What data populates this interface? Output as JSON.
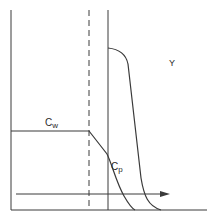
{
  "diagram": {
    "labels": {
      "cw": {
        "main": "C",
        "sub": "w"
      },
      "cp": {
        "main": "C",
        "sub": "p"
      },
      "y": "Y"
    },
    "colors": {
      "line": "#3a3a3a",
      "background": "#ffffff"
    },
    "elements": {
      "left_axis": "vertical axis",
      "bottom_axis": "horizontal axis",
      "dashed_boundary": "dashed vertical line",
      "solid_boundary": "solid vertical line",
      "flux_arrow": "rightward arrow"
    }
  }
}
